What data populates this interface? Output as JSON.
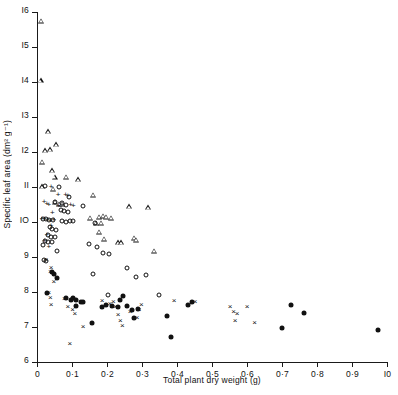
{
  "chart_data": {
    "type": "scatter",
    "title": "",
    "xlabel": "Total plant dry weight (g)",
    "ylabel": "Specific leaf area (dm² g⁻¹)",
    "xlim": [
      0,
      1.0
    ],
    "ylim": [
      6,
      16
    ],
    "grid": false,
    "legend": "none",
    "xticks": [
      0,
      0.1,
      0.2,
      0.3,
      0.4,
      0.5,
      0.6,
      0.7,
      0.8,
      0.9,
      1.0
    ],
    "xticklabels": [
      "0",
      "0·1",
      "0·2",
      "0·3",
      "0·4",
      "0·5",
      "0·6",
      "0·7",
      "0·8",
      "0·9",
      "I0"
    ],
    "yticks": [
      6,
      7,
      8,
      9,
      10,
      11,
      12,
      13,
      14,
      15,
      16
    ],
    "yticklabels": [
      "6",
      "7",
      "8",
      "9",
      "IO",
      "II",
      "I2",
      "I3",
      "I4",
      "I5",
      "I6"
    ],
    "series": [
      {
        "name": "open-triangle",
        "marker": "open-triangle",
        "points": [
          [
            0.012,
            15.75
          ],
          [
            0.01,
            14.05
          ],
          [
            0.032,
            12.6
          ],
          [
            0.055,
            12.22
          ],
          [
            0.022,
            12.05
          ],
          [
            0.038,
            12.08
          ],
          [
            0.014,
            11.72
          ],
          [
            0.042,
            11.48
          ],
          [
            0.05,
            11.3
          ],
          [
            0.082,
            11.3
          ],
          [
            0.118,
            11.22
          ],
          [
            0.014,
            11.02
          ],
          [
            0.046,
            10.95
          ],
          [
            0.16,
            10.78
          ],
          [
            0.052,
            10.58
          ],
          [
            0.064,
            10.52
          ],
          [
            0.072,
            10.52
          ],
          [
            0.262,
            10.45
          ],
          [
            0.318,
            10.42
          ],
          [
            0.152,
            10.12
          ],
          [
            0.178,
            10.15
          ],
          [
            0.188,
            10.18
          ],
          [
            0.198,
            10.15
          ],
          [
            0.212,
            10.12
          ],
          [
            0.168,
            9.98
          ],
          [
            0.184,
            9.98
          ],
          [
            0.178,
            9.72
          ],
          [
            0.192,
            9.52
          ],
          [
            0.232,
            9.42
          ],
          [
            0.24,
            9.42
          ],
          [
            0.276,
            9.55
          ],
          [
            0.282,
            9.5
          ],
          [
            0.334,
            9.18
          ]
        ]
      },
      {
        "name": "open-circle",
        "marker": "open-circle",
        "points": [
          [
            0.024,
            11.02
          ],
          [
            0.062,
            11.0
          ],
          [
            0.09,
            10.72
          ],
          [
            0.052,
            10.58
          ],
          [
            0.07,
            10.55
          ],
          [
            0.084,
            10.48
          ],
          [
            0.068,
            10.35
          ],
          [
            0.078,
            10.32
          ],
          [
            0.088,
            10.3
          ],
          [
            0.13,
            10.45
          ],
          [
            0.018,
            10.08
          ],
          [
            0.026,
            10.08
          ],
          [
            0.034,
            10.05
          ],
          [
            0.046,
            10.05
          ],
          [
            0.072,
            10.02
          ],
          [
            0.082,
            10.0
          ],
          [
            0.094,
            10.02
          ],
          [
            0.104,
            10.02
          ],
          [
            0.166,
            9.98
          ],
          [
            0.036,
            9.85
          ],
          [
            0.044,
            9.8
          ],
          [
            0.054,
            9.78
          ],
          [
            0.03,
            9.62
          ],
          [
            0.04,
            9.58
          ],
          [
            0.05,
            9.58
          ],
          [
            0.022,
            9.45
          ],
          [
            0.03,
            9.42
          ],
          [
            0.044,
            9.42
          ],
          [
            0.018,
            9.35
          ],
          [
            0.056,
            9.18
          ],
          [
            0.148,
            9.38
          ],
          [
            0.172,
            9.3
          ],
          [
            0.188,
            9.12
          ],
          [
            0.206,
            9.1
          ],
          [
            0.258,
            8.68
          ],
          [
            0.16,
            8.52
          ],
          [
            0.284,
            8.42
          ],
          [
            0.312,
            8.5
          ],
          [
            0.204,
            7.92
          ],
          [
            0.348,
            7.92
          ],
          [
            0.02,
            8.92
          ],
          [
            0.026,
            8.9
          ]
        ]
      },
      {
        "name": "plus",
        "marker": "plus",
        "points": [
          [
            0.04,
            11.0
          ],
          [
            0.06,
            10.78
          ],
          [
            0.082,
            10.78
          ],
          [
            0.088,
            10.75
          ],
          [
            0.02,
            10.58
          ],
          [
            0.028,
            10.52
          ],
          [
            0.034,
            10.5
          ],
          [
            0.062,
            10.45
          ],
          [
            0.096,
            10.48
          ],
          [
            0.104,
            10.45
          ],
          [
            0.014,
            10.1
          ],
          [
            0.022,
            10.08
          ],
          [
            0.03,
            10.05
          ],
          [
            0.038,
            10.04
          ],
          [
            0.048,
            10.05
          ],
          [
            0.04,
            9.9
          ],
          [
            0.028,
            9.62
          ],
          [
            0.022,
            9.45
          ],
          [
            0.034,
            9.28
          ],
          [
            0.044,
            10.25
          ]
        ]
      },
      {
        "name": "filled-circle",
        "marker": "filled-circle",
        "points": [
          [
            0.042,
            8.58
          ],
          [
            0.048,
            8.52
          ],
          [
            0.056,
            8.4
          ],
          [
            0.028,
            7.98
          ],
          [
            0.084,
            7.82
          ],
          [
            0.098,
            7.78
          ],
          [
            0.104,
            7.82
          ],
          [
            0.112,
            7.78
          ],
          [
            0.112,
            7.6
          ],
          [
            0.126,
            7.72
          ],
          [
            0.13,
            7.72
          ],
          [
            0.158,
            7.12
          ],
          [
            0.186,
            7.58
          ],
          [
            0.196,
            7.62
          ],
          [
            0.214,
            7.6
          ],
          [
            0.232,
            7.58
          ],
          [
            0.238,
            7.78
          ],
          [
            0.246,
            7.9
          ],
          [
            0.258,
            7.6
          ],
          [
            0.272,
            7.48
          ],
          [
            0.276,
            7.26
          ],
          [
            0.288,
            7.52
          ],
          [
            0.37,
            7.32
          ],
          [
            0.382,
            6.72
          ],
          [
            0.43,
            7.64
          ],
          [
            0.444,
            7.72
          ],
          [
            0.7,
            6.98
          ],
          [
            0.726,
            7.62
          ],
          [
            0.762,
            7.4
          ],
          [
            0.975,
            6.92
          ]
        ]
      },
      {
        "name": "cross",
        "marker": "cross",
        "points": [
          [
            0.026,
            8.92
          ],
          [
            0.04,
            8.7
          ],
          [
            0.038,
            8.58
          ],
          [
            0.048,
            8.3
          ],
          [
            0.034,
            7.98
          ],
          [
            0.038,
            7.82
          ],
          [
            0.04,
            7.62
          ],
          [
            0.078,
            7.8
          ],
          [
            0.088,
            7.56
          ],
          [
            0.102,
            7.48
          ],
          [
            0.108,
            7.36
          ],
          [
            0.132,
            7.0
          ],
          [
            0.094,
            6.52
          ],
          [
            0.186,
            7.74
          ],
          [
            0.208,
            7.66
          ],
          [
            0.218,
            7.72
          ],
          [
            0.224,
            7.56
          ],
          [
            0.232,
            7.34
          ],
          [
            0.238,
            7.18
          ],
          [
            0.244,
            7.02
          ],
          [
            0.266,
            7.42
          ],
          [
            0.286,
            7.26
          ],
          [
            0.292,
            7.48
          ],
          [
            0.298,
            7.62
          ],
          [
            0.392,
            7.74
          ],
          [
            0.452,
            7.72
          ],
          [
            0.552,
            7.58
          ],
          [
            0.562,
            7.42
          ],
          [
            0.572,
            7.38
          ],
          [
            0.566,
            7.18
          ],
          [
            0.6,
            7.56
          ],
          [
            0.622,
            7.12
          ]
        ]
      }
    ]
  }
}
